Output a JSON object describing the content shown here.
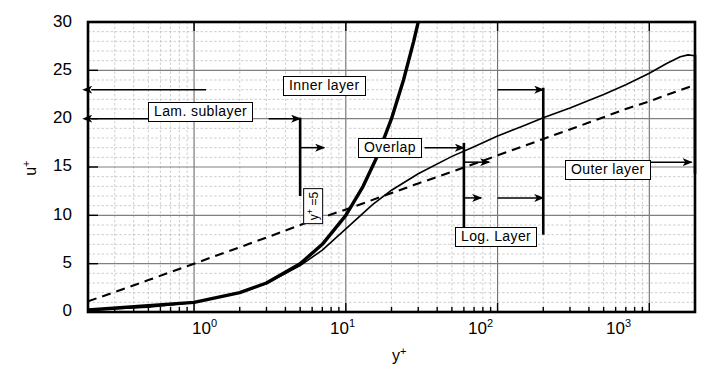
{
  "chart_data": {
    "type": "line",
    "title": "",
    "xlabel": "y+",
    "ylabel": "u+",
    "xscale": "log",
    "yscale": "linear",
    "xlim": [
      0.2,
      2000
    ],
    "ylim": [
      0,
      30
    ],
    "grid": "log-minor-and-major",
    "legend": "none",
    "y_ticks": [
      0,
      5,
      10,
      15,
      20,
      25,
      30
    ],
    "y_tick_labels": [
      "0",
      "5",
      "10",
      "15",
      "20",
      "25",
      "30"
    ],
    "x_ticks": [
      1,
      10,
      100,
      1000
    ],
    "x_tick_labels": [
      "10^0",
      "10^1",
      "10^2",
      "10^3"
    ],
    "x_tick_mantissa": [
      "10",
      "10",
      "10",
      "10"
    ],
    "x_tick_exponent": [
      "0",
      "1",
      "2",
      "3"
    ],
    "series": [
      {
        "name": "viscous sublayer / experimental profile (solid)",
        "style": "solid",
        "x": [
          0.2,
          0.5,
          1,
          2,
          3,
          5,
          7,
          10,
          15,
          20,
          30,
          50,
          70,
          100,
          150,
          200,
          300,
          500,
          700,
          1000,
          1300,
          1600,
          1800,
          2000
        ],
        "y": [
          0.2,
          0.5,
          1.0,
          2.0,
          2.95,
          4.8,
          6.4,
          8.6,
          11.1,
          12.6,
          14.3,
          16.1,
          17.1,
          18.2,
          19.3,
          20.1,
          21.1,
          22.5,
          23.5,
          24.7,
          25.7,
          26.4,
          26.6,
          26.5
        ]
      },
      {
        "name": "law of the wall u+ = y+ (steep solid)",
        "style": "solid-thick",
        "x": [
          0.2,
          1,
          2,
          3,
          5,
          7,
          10,
          13,
          16,
          20,
          24,
          28,
          30
        ],
        "y": [
          0.2,
          1,
          2,
          3,
          5,
          7,
          10,
          13,
          16,
          20,
          24,
          28,
          30
        ]
      },
      {
        "name": "log law u+ = (1/0.41) ln y+ + 5.0 (dashed)",
        "style": "dashed",
        "x": [
          0.2,
          0.5,
          1,
          2,
          3,
          5,
          7,
          10,
          20,
          30,
          50,
          100,
          200,
          400,
          700,
          1000,
          1500,
          2000
        ],
        "y": [
          1.1,
          3.3,
          5.0,
          6.7,
          7.7,
          9.0,
          9.8,
          10.6,
          12.3,
          13.3,
          14.5,
          16.2,
          17.9,
          19.6,
          21.0,
          21.8,
          22.8,
          23.5
        ]
      }
    ],
    "annotations": [
      {
        "id": "lam-sublayer",
        "text": "Lam. sublayer",
        "x_range": [
          0.2,
          5
        ],
        "y_level": 20
      },
      {
        "id": "inner-layer",
        "text": "Inner layer",
        "x_range": [
          0.2,
          200
        ],
        "y_level": 23
      },
      {
        "id": "overlap",
        "text": "Overlap",
        "x_range": [
          5,
          100
        ],
        "y_level": 17
      },
      {
        "id": "log-layer",
        "text": "Log. Layer",
        "x_range": [
          60,
          200
        ],
        "y_level": 11.8
      },
      {
        "id": "outer-layer",
        "text": "Outer layer",
        "x_range": [
          60,
          2000
        ],
        "y_level": 15.5
      },
      {
        "id": "y-plus-5",
        "text": "y+ =5",
        "x_value": 5
      }
    ]
  },
  "axes": {
    "y_title": "u",
    "y_title_sup": "+",
    "x_title": "y",
    "x_title_sup": "+",
    "y_tick_labels": [
      "30",
      "25",
      "20",
      "15",
      "10",
      "5",
      "0"
    ],
    "x_tick_base": "10",
    "x_tick_exps": [
      "0",
      "1",
      "2",
      "3"
    ]
  },
  "labels": {
    "lam_sublayer": "Lam. sublayer",
    "inner_layer": "Inner layer",
    "overlap": "Overlap",
    "log_layer": "Log. Layer",
    "outer_layer": "Outer layer",
    "y_plus_5_base": "y",
    "y_plus_5_sup": "+",
    "y_plus_5_rest": " =5"
  },
  "colors": {
    "axis": "#000000",
    "curve": "#000000",
    "grid_major": "#8a8a8a",
    "grid_minor": "#b9b9b9",
    "background": "#ffffff"
  }
}
